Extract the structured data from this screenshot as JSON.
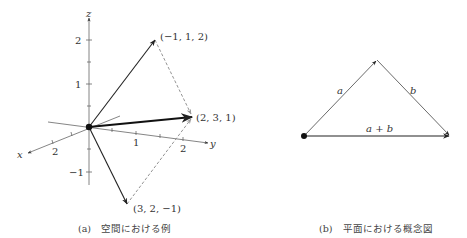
{
  "figure_a": {
    "caption_tag": "(a)",
    "caption_text": "空間における例",
    "axes": {
      "x_label": "x",
      "y_label": "y",
      "z_label": "z",
      "x_ticks": [
        "2"
      ],
      "y_ticks": [
        "1",
        "2"
      ],
      "z_ticks": [
        "2",
        "1",
        "−1"
      ]
    },
    "vectors": [
      {
        "label": "(−1, 1, 2)",
        "style": "solid"
      },
      {
        "label": "(3, 2, −1)",
        "style": "solid"
      },
      {
        "label": "(2, 3, 1)",
        "style": "bold"
      }
    ]
  },
  "figure_b": {
    "caption_tag": "(b)",
    "caption_text": "平面における概念図",
    "vectors": [
      {
        "label": "a"
      },
      {
        "label": "b"
      },
      {
        "label": "a + b"
      }
    ]
  },
  "colors": {
    "vector": "#222222",
    "axis": "#555555",
    "dashed": "#888888"
  }
}
